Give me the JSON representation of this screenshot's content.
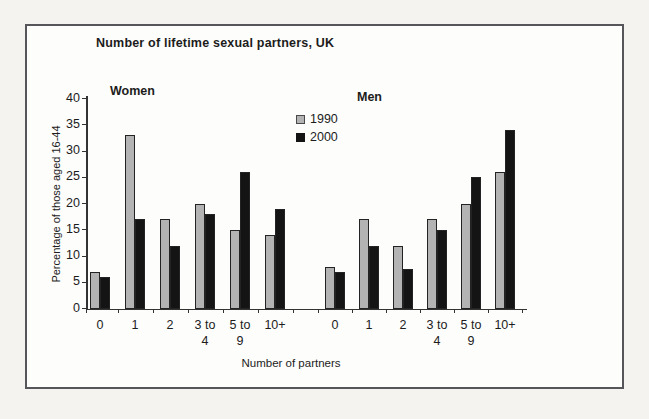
{
  "figure": {
    "title": "Number of lifetime sexual partners, UK",
    "xlabel": "Number of partners",
    "ylabel": "Percentage of those aged 16-44"
  },
  "legend": {
    "position": "top-center",
    "items": [
      {
        "label": "1990",
        "color": "#b3b3b3"
      },
      {
        "label": "2000",
        "color": "#141414"
      }
    ]
  },
  "chart_data": {
    "type": "bar",
    "title": "Number of lifetime sexual partners, UK",
    "xlabel": "Number of partners",
    "ylabel": "Percentage of those aged 16-44",
    "ylim": [
      0,
      40
    ],
    "yticks": [
      0,
      5,
      10,
      15,
      20,
      25,
      30,
      35,
      40
    ],
    "grid": false,
    "legend_position": "top-center",
    "categories": [
      "0",
      "1",
      "2",
      "3 to 4",
      "5 to 9",
      "10+"
    ],
    "groups": [
      {
        "label": "Women",
        "categories": [
          "0",
          "1",
          "2",
          "3 to 4",
          "5 to 9",
          "10+"
        ],
        "series": [
          {
            "name": "1990",
            "color": "#b3b3b3",
            "values": [
              7,
              33,
              17,
              20,
              15,
              14
            ]
          },
          {
            "name": "2000",
            "color": "#141414",
            "values": [
              6,
              17,
              12,
              18,
              26,
              19
            ]
          }
        ]
      },
      {
        "label": "Men",
        "categories": [
          "0",
          "1",
          "2",
          "3 to 4",
          "5 to 9",
          "10+"
        ],
        "series": [
          {
            "name": "1990",
            "color": "#b3b3b3",
            "values": [
              8,
              17,
              12,
              17,
              20,
              26
            ]
          },
          {
            "name": "2000",
            "color": "#141414",
            "values": [
              7,
              12,
              7.5,
              15,
              25,
              34
            ]
          }
        ]
      }
    ]
  }
}
